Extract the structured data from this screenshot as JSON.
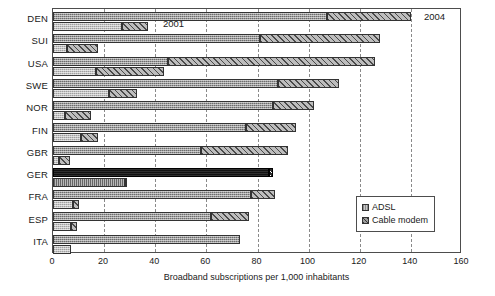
{
  "chart_data": {
    "type": "bar",
    "orientation": "horizontal",
    "title": "",
    "xlabel": "Broadband subscriptions per 1,000 inhabitants",
    "ylabel": "",
    "xlim": [
      0,
      160
    ],
    "xticks": [
      0,
      20,
      40,
      60,
      80,
      100,
      120,
      140,
      160
    ],
    "xtick_labels": [
      "0",
      "20",
      "40",
      "60",
      "80",
      "100",
      "120",
      "140",
      "160"
    ],
    "grid": "vertical-dashed",
    "legend_position": "lower-right",
    "legend": [
      "ADSL",
      "Cable modem"
    ],
    "annotations": [
      {
        "text": "2001",
        "note": "labels the lower bar of each pair"
      },
      {
        "text": "2004",
        "note": "labels the upper bar of each pair"
      }
    ],
    "categories": [
      "DEN",
      "SUI",
      "USA",
      "SWE",
      "NOR",
      "FIN",
      "GBR",
      "GER",
      "FRA",
      "ESP",
      "ITA"
    ],
    "highlight_category": "GER",
    "series": [
      {
        "name": "2004",
        "stacks": [
          {
            "name": "ADSL",
            "values": [
              107,
              81,
              45,
              88,
              86,
              75.5,
              58,
              84.5,
              77.5,
              62,
              73
            ]
          },
          {
            "name": "Cable modem",
            "values": [
              33,
              47,
              81,
              24,
              16,
              19.5,
              34,
              1.5,
              9.5,
              14.5,
              0
            ]
          }
        ],
        "totals": [
          140,
          128,
          126,
          112,
          102,
          95,
          92,
          86,
          87,
          76.5,
          73
        ]
      },
      {
        "name": "2001",
        "stacks": [
          {
            "name": "ADSL",
            "values": [
              27,
              5.5,
              17,
              22,
              4.5,
              11,
              2.5,
              28,
              8,
              7,
              7
            ]
          },
          {
            "name": "Cable modem",
            "values": [
              10,
              12,
              26.5,
              11,
              10.5,
              6.5,
              4,
              0.8,
              2,
              2.5,
              0
            ]
          }
        ],
        "totals": [
          37,
          17.5,
          43.5,
          33,
          15,
          17.5,
          6.5,
          28.8,
          10,
          9.5,
          7
        ]
      }
    ]
  },
  "legend": {
    "adsl_label": "ADSL",
    "cable_label": "Cable modem"
  },
  "axis": {
    "title": "Broadband subscriptions per 1,000 inhabitants"
  },
  "annotations": {
    "year_early": "2001",
    "year_late": "2004"
  }
}
